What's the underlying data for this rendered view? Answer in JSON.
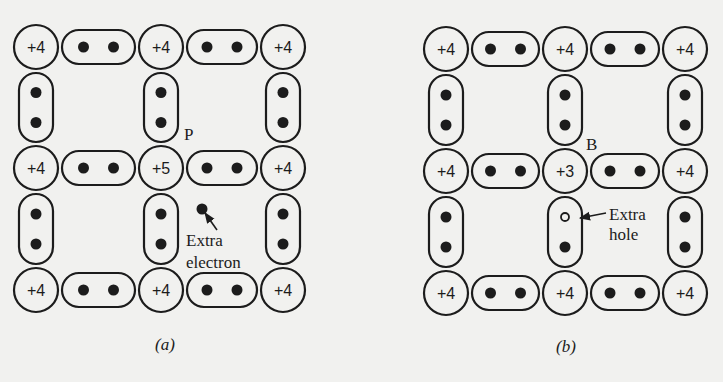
{
  "colors": {
    "ink": "#1c1c1c",
    "paper": "#f1f1ef"
  },
  "panels": [
    {
      "id": "a",
      "caption": "(a)",
      "caption_pos": [
        155,
        350
      ],
      "columns_x": [
        36,
        161,
        283
      ],
      "rows_y": [
        47,
        168,
        290
      ],
      "atoms": [
        [
          "+4",
          "+4",
          "+4"
        ],
        [
          "+4",
          "+5",
          "+4"
        ],
        [
          "+4",
          "+4",
          "+4"
        ]
      ],
      "impurity_label": {
        "text": "P",
        "x": 184,
        "y": 140
      },
      "annotation": {
        "lines": [
          "Extra",
          "electron"
        ],
        "x": 186,
        "y": 246,
        "line_height": 22,
        "particle": "electron",
        "particle_pos": [
          202,
          209
        ],
        "arrow_from": [
          217,
          230
        ],
        "arrow_to": [
          205,
          213
        ]
      },
      "missing_bond_hole": null
    },
    {
      "id": "b",
      "caption": "(b)",
      "caption_pos": [
        556,
        352
      ],
      "columns_x": [
        446,
        565,
        685
      ],
      "rows_y": [
        49,
        171,
        293
      ],
      "atoms": [
        [
          "+4",
          "+4",
          "+4"
        ],
        [
          "+4",
          "+3",
          "+4"
        ],
        [
          "+4",
          "+4",
          "+4"
        ]
      ],
      "impurity_label": {
        "text": "B",
        "x": 586,
        "y": 150
      },
      "annotation": {
        "lines": [
          "Extra",
          "hole"
        ],
        "x": 609,
        "y": 220,
        "line_height": 20,
        "particle": "hole",
        "particle_pos": [
          563,
          215
        ],
        "arrow_from": [
          606,
          213
        ],
        "arrow_to": [
          580,
          218
        ]
      }
    }
  ]
}
